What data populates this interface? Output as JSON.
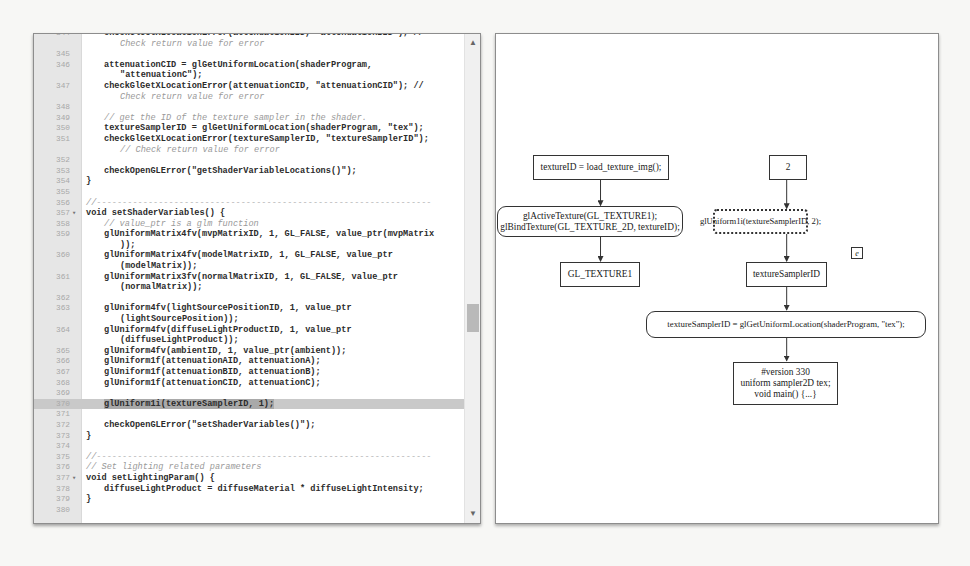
{
  "editor": {
    "lines": [
      {
        "n": "344",
        "text": "checkGlGetXLocationError(attenuationBID, \"attenuationBID\"); //",
        "indent": 1
      },
      {
        "n": "",
        "text": "Check return value for error",
        "cont": true,
        "comment": true
      },
      {
        "n": "345",
        "text": ""
      },
      {
        "n": "346",
        "text": "attenuationCID = glGetUniformLocation(shaderProgram,",
        "indent": 1
      },
      {
        "n": "",
        "text": "\"attenuationC\");",
        "cont": true
      },
      {
        "n": "347",
        "text": "checkGlGetXLocationError(attenuationCID, \"attenuationCID\"); //",
        "indent": 1
      },
      {
        "n": "",
        "text": "Check return value for error",
        "cont": true,
        "comment": true
      },
      {
        "n": "348",
        "text": ""
      },
      {
        "n": "349",
        "text": "// get the ID of the texture sampler in the shader.",
        "indent": 1,
        "comment": true
      },
      {
        "n": "350",
        "text": "textureSamplerID = glGetUniformLocation(shaderProgram, \"tex\");",
        "indent": 1
      },
      {
        "n": "351",
        "text": "checkGlGetXLocationError(textureSamplerID, \"textureSamplerID\");",
        "indent": 1
      },
      {
        "n": "",
        "text": "// Check return value for error",
        "cont": true,
        "comment": true
      },
      {
        "n": "352",
        "text": ""
      },
      {
        "n": "353",
        "text": "checkOpenGLError(\"getShaderVariableLocations()\");",
        "indent": 1
      },
      {
        "n": "354",
        "text": "}"
      },
      {
        "n": "355",
        "text": ""
      },
      {
        "n": "356",
        "text": "//-----------------------------------------------------------------",
        "comment": true
      },
      {
        "n": "357",
        "text": "void setShaderVariables() {",
        "fold": true
      },
      {
        "n": "358",
        "text": "// value_ptr is a glm function",
        "indent": 1,
        "comment": true
      },
      {
        "n": "359",
        "text": "glUniformMatrix4fv(mvpMatrixID, 1, GL_FALSE, value_ptr(mvpMatrix",
        "indent": 1
      },
      {
        "n": "",
        "text": "));",
        "cont": true
      },
      {
        "n": "360",
        "text": "glUniformMatrix4fv(modelMatrixID, 1, GL_FALSE, value_ptr",
        "indent": 1
      },
      {
        "n": "",
        "text": "(modelMatrix));",
        "cont": true
      },
      {
        "n": "361",
        "text": "glUniformMatrix3fv(normalMatrixID, 1, GL_FALSE, value_ptr",
        "indent": 1
      },
      {
        "n": "",
        "text": "(normalMatrix));",
        "cont": true
      },
      {
        "n": "362",
        "text": ""
      },
      {
        "n": "363",
        "text": "glUniform4fv(lightSourcePositionID, 1, value_ptr",
        "indent": 1
      },
      {
        "n": "",
        "text": "(lightSourcePosition));",
        "cont": true
      },
      {
        "n": "364",
        "text": "glUniform4fv(diffuseLightProductID, 1, value_ptr",
        "indent": 1
      },
      {
        "n": "",
        "text": "(diffuseLightProduct));",
        "cont": true
      },
      {
        "n": "365",
        "text": "glUniform4fv(ambientID, 1, value_ptr(ambient));",
        "indent": 1
      },
      {
        "n": "366",
        "text": "glUniform1f(attenuationAID, attenuationA);",
        "indent": 1
      },
      {
        "n": "367",
        "text": "glUniform1f(attenuationBID, attenuationB);",
        "indent": 1
      },
      {
        "n": "368",
        "text": "glUniform1f(attenuationCID, attenuationC);",
        "indent": 1
      },
      {
        "n": "369",
        "text": ""
      },
      {
        "n": "370",
        "text": "glUniform1i(textureSamplerID, 1);",
        "indent": 1,
        "highlight": true
      },
      {
        "n": "371",
        "text": ""
      },
      {
        "n": "372",
        "text": "checkOpenGLError(\"setShaderVariables()\");",
        "indent": 1
      },
      {
        "n": "373",
        "text": "}"
      },
      {
        "n": "374",
        "text": ""
      },
      {
        "n": "375",
        "text": "//-----------------------------------------------------------------",
        "comment": true
      },
      {
        "n": "376",
        "text": "// Set lighting related parameters",
        "comment": true
      },
      {
        "n": "377",
        "text": "void setLightingParam() {",
        "fold": true
      },
      {
        "n": "378",
        "text": "diffuseLightProduct = diffuseMaterial * diffuseLightIntensity;",
        "indent": 1
      },
      {
        "n": "379",
        "text": "}"
      },
      {
        "n": "380",
        "text": ""
      }
    ],
    "scroll_up_icon": "▲",
    "scroll_down_icon": "▼",
    "highlight_color": "#a9a9a9"
  },
  "diagram": {
    "nodes": {
      "texture_id": "textureID = load_texture_img();",
      "value_2": "2",
      "active_texture": "glActiveTexture(GL_TEXTURE1);\nglBindTexture(GL_TEXTURE_2D, textureID);",
      "uniform1i": "glUniform1i(textureSamplerID, 2);",
      "marker_e": "e",
      "gl_texture1": "GL_TEXTURE1",
      "texture_sampler_id": "textureSamplerID",
      "get_uniform_location": "textureSamplerID = glGetUniformLocation(shaderProgram, \"tex\");",
      "shader_source": "#version 330\nuniform sampler2D tex;\nvoid main() {...}"
    }
  },
  "background": {
    "lines": [
      "1  Conclusions and Future Work",
      "In the present work, the visual language and its analysis were evaluated",
      "References"
    ]
  }
}
